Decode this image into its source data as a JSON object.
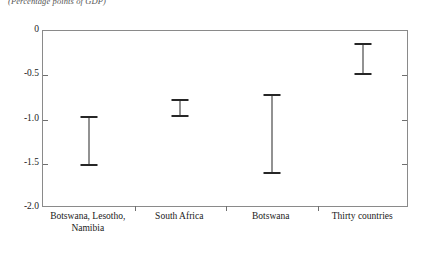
{
  "chart_data": {
    "type": "bar",
    "subtype": "error-bar-range",
    "title": "",
    "note": "(Percentage points of GDP)",
    "xlabel": "",
    "ylabel": "",
    "ylim": [
      -2.0,
      0
    ],
    "yticks": [
      0,
      -0.5,
      -1.0,
      -1.5,
      -2.0
    ],
    "ytick_labels": [
      "0",
      "-0.5",
      "-1.0",
      "-1.5",
      "-2.0"
    ],
    "grid": false,
    "legend": null,
    "categories": [
      "Botswana, Lesotho, Namibia",
      "South Africa",
      "Botswana",
      "Thirty countries"
    ],
    "category_lines": [
      [
        "Botswana, Lesotho,",
        "Namibia"
      ],
      [
        "South Africa"
      ],
      [
        "Botswana"
      ],
      [
        "Thirty countries"
      ]
    ],
    "series": [
      {
        "name": "range",
        "low": [
          -1.51,
          -0.96,
          -1.6,
          -0.49
        ],
        "high": [
          -0.97,
          -0.78,
          -0.72,
          -0.15
        ]
      }
    ],
    "colors": {
      "bar": "#262626",
      "axis": "#8a8a8a",
      "tick": "#6f6f6f",
      "text": "#1a1a1a",
      "note": "#555555",
      "background": "#ffffff"
    }
  }
}
